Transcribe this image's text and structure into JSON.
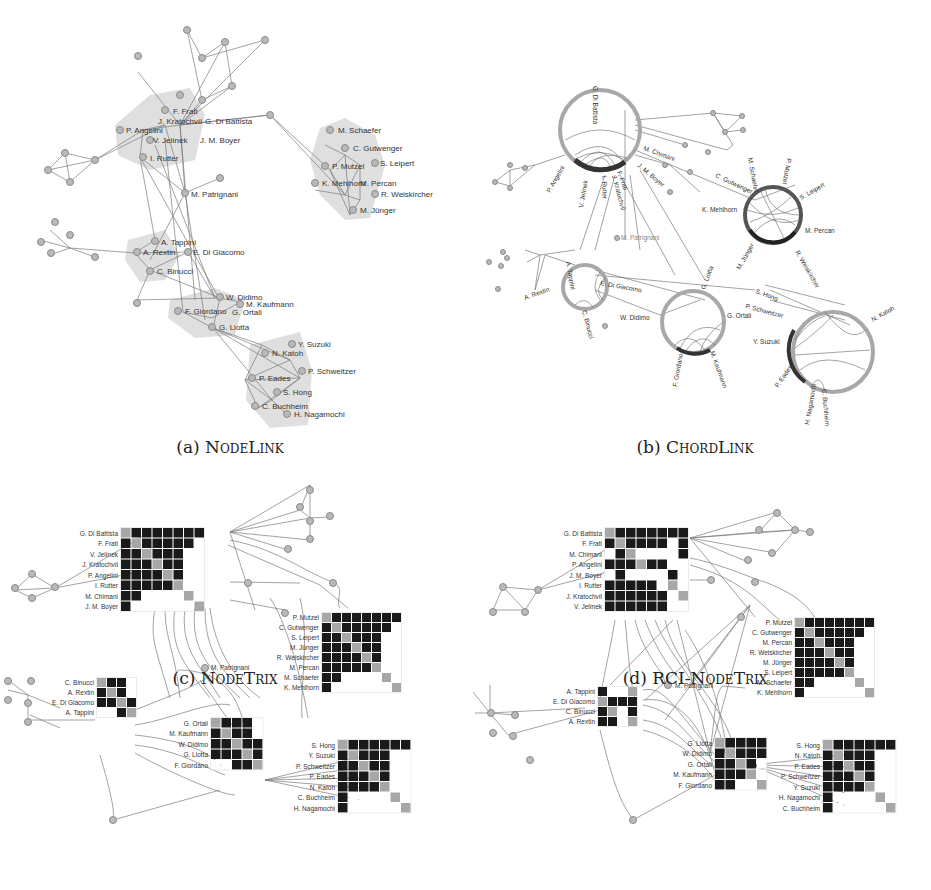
{
  "figure": {
    "panels": [
      {
        "id": "a",
        "caption_prefix": "(a) ",
        "caption_name": "NodeLink",
        "clusters": [
          {
            "name": "cluster-1",
            "labels": [
              "F. Frati",
              "J. Kratochvíl",
              "G. Di Battista",
              "P. Angelini",
              "V. Jelínek",
              "J. M. Boyer",
              "I. Rutter"
            ]
          },
          {
            "name": "cluster-2",
            "labels": [
              "M. Schaefer",
              "C. Gutwenger",
              "P. Mutzel",
              "S. Leipert",
              "K. Mehlhorn",
              "M. Percan",
              "R. Weiskircher",
              "M. Jünger"
            ]
          },
          {
            "name": "cluster-3",
            "labels": [
              "A. Tappini",
              "A. Rextin",
              "E. Di Giacomo",
              "C. Binucci"
            ]
          },
          {
            "name": "cluster-4",
            "labels": [
              "W. Didimo",
              "M. Kaufmann",
              "F. Giordano",
              "G. Ortali",
              "G. Liotta"
            ]
          },
          {
            "name": "cluster-5",
            "labels": [
              "Y. Suzuki",
              "N. Katoh",
              "P. Schweitzer",
              "P. Eades",
              "S. Hong",
              "C. Buchheim",
              "H. Nagamochi"
            ]
          }
        ],
        "free_labels": [
          "M. Patrignani"
        ]
      },
      {
        "id": "b",
        "caption_prefix": "(b) ",
        "caption_name": "ChordLink",
        "chord_groups": [
          {
            "labels": [
              "G. Di Battista",
              "P. Angelini",
              "V. Jelínek",
              "I. Rutter",
              "J. Kratochvíl",
              "F. Frati",
              "J. M. Boyer",
              "M. Chimani"
            ]
          },
          {
            "labels": [
              "M. Schaefer",
              "P. Mutzel",
              "S. Leipert",
              "C. Gutwenger",
              "K. Mehlhorn",
              "M. Percan",
              "M. Jünger",
              "R. Weiskircher"
            ]
          },
          {
            "labels": [
              "A. Tappini",
              "A. Rextin",
              "E. Di Giacomo",
              "C. Binucci"
            ]
          },
          {
            "labels": [
              "G. Liotta",
              "W. Didimo",
              "G. Ortali",
              "F. Giordano",
              "M. Kaufmann"
            ]
          },
          {
            "labels": [
              "S. Hong",
              "P. Schweitzer",
              "Y. Suzuki",
              "N. Katoh",
              "P. Eades",
              "H. Nagamochi",
              "C. Buchheim"
            ]
          }
        ],
        "free_labels": [
          "M. Patrignani"
        ]
      },
      {
        "id": "c",
        "caption_prefix": "(c) ",
        "caption_name": "NodeTrix",
        "matrices": [
          {
            "rows": [
              "G. Di Battista",
              "F. Frati",
              "V. Jelínek",
              "J. Kratochvíl",
              "P. Angelini",
              "I. Rutter",
              "M. Chimani",
              "J. M. Boyer"
            ],
            "cells": [
              "D11111111",
              "1D111110",
              "11D11100",
              "111D1100",
              "1111D100",
              "11111D00",
              "110000D0",
              "1000000D"
            ]
          },
          {
            "rows": [
              "P. Mutzel",
              "C. Gutwenger",
              "S. Leipert",
              "M. Jünger",
              "R. Weiskircher",
              "M. Percan",
              "M. Schaefer",
              "K. Mehlhorn"
            ],
            "cells": [
              "D1111111",
              "1D111110",
              "11D11100",
              "111D1100",
              "1111D100",
              "11111D00",
              "110000D0",
              "1000000D"
            ]
          },
          {
            "rows": [
              "C. Binucci",
              "A. Rextin",
              "E. Di Giacomo",
              "A. Tappini"
            ],
            "cells": [
              "D110",
              "1D10",
              "11D1",
              "001D"
            ]
          },
          {
            "rows": [
              "G. Ortali",
              "M. Kaufmann",
              "W. Didimo",
              "G. Liotta",
              "F. Giordano"
            ],
            "cells": [
              "D1110",
              "1D110",
              "11D11",
              "111D1",
              "0011D"
            ]
          },
          {
            "rows": [
              "S. Hong",
              "Y. Suzuki",
              "P. Schweitzer",
              "P. Eades",
              "N. Katoh",
              "C. Buchheim",
              "H. Nagamochi"
            ],
            "cells": [
              "D111111",
              "1D11100",
              "11D1100",
              "111D100",
              "1111D00",
              "10000D0",
              "100000D"
            ]
          }
        ],
        "free_labels": [
          "M. Patrignani"
        ]
      },
      {
        "id": "d",
        "caption_prefix": "(d) ",
        "caption_name": "RCI-NodeTrix",
        "matrices": [
          {
            "rows": [
              "G. Di Battista",
              "F. Frati",
              "M. Chimani",
              "P. Angelini",
              "J. M. Boyer",
              "I. Rutter",
              "J. Kratochvíl",
              "V. Jelínek"
            ],
            "cells": [
              "D1111111",
              "1D11110 1",
              "01D00001",
              "111D1100",
              "01000010",
              "111110D0",
              "1111110D",
              "11111100"
            ]
          },
          {
            "rows": [
              "P. Mutzel",
              "C. Gutwenger",
              "M. Percan",
              "R. Weiskircher",
              "M. Jünger",
              "S. Leipert",
              "M. Schaefer",
              "K. Mehlhorn"
            ],
            "cells": [
              "D1111111",
              "1D111110",
              "11D11100",
              "111D1100",
              "1111D100",
              "11111D00",
              "110000D0",
              "1000000D"
            ]
          },
          {
            "rows": [
              "A. Tappini",
              "E. Di Giacomo",
              "C. Binucci",
              "A. Rextin"
            ],
            "cells": [
              "100D",
              "D111",
              "1D01",
              "110D"
            ]
          },
          {
            "rows": [
              "G. Liotta",
              "W. Didimo",
              "G. Ortali",
              "M. Kaufmann",
              "F. Giordano"
            ],
            "cells": [
              "D1111",
              "1D111",
              "11D10",
              "111D0",
              "1100D"
            ]
          },
          {
            "rows": [
              "S. Hong",
              "N. Katoh",
              "P. Eades",
              "P. Schweitzer",
              "Y. Suzuki",
              "H. Nagamochi",
              "C. Buchheim"
            ],
            "cells": [
              "D111111",
              "1D11100",
              "11D1100",
              "111D100",
              "1111D00",
              "10000D0",
              "100000D"
            ]
          }
        ],
        "free_labels": [
          "M. Patrignani"
        ]
      }
    ],
    "colors": {
      "edge": "#7a7a7a",
      "node_fill": "#b9b9b9",
      "hull": "#d4d4d4",
      "cell_on": "#1a1a1a",
      "cell_diag": "#a7a7a7"
    }
  }
}
